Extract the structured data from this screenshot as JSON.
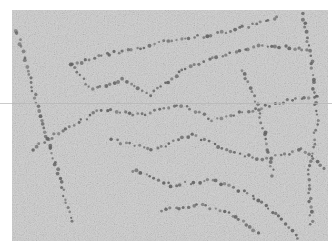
{
  "image": {
    "subject": "electron micrograph of chromatin fibers (beads-on-a-string)",
    "tones": {
      "background": "#c9c9c9",
      "speckle_dark": "#8a8a8a",
      "speckle_light": "#e6e6e6",
      "bead": "#5e5e5e"
    }
  }
}
